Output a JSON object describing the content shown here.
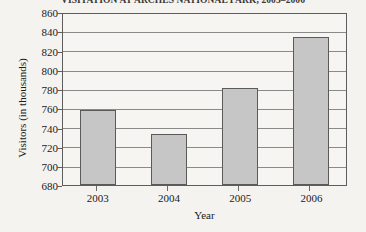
{
  "chart_data": {
    "type": "bar",
    "title": "VISITATION AT ARCHES NATIONAL PARK, 2003–2006",
    "xlabel": "Year",
    "ylabel": "Visitors (in thousands)",
    "categories": [
      "2003",
      "2004",
      "2005",
      "2006"
    ],
    "values": [
      759,
      734,
      782,
      836
    ],
    "ylim": [
      680,
      860
    ],
    "ytick_step": 20,
    "yticks": [
      "680",
      "700",
      "720",
      "740",
      "760",
      "780",
      "800",
      "820",
      "840",
      "860"
    ],
    "grid": true,
    "legend": null,
    "colors": {
      "bar_fill": "#c6c6c6",
      "bar_border": "#5a5a5a",
      "plot_background": "#f7f5f2",
      "page_background": "#f5f3f0",
      "gridline": "#8a8a8a",
      "text": "#1a1a1a"
    }
  }
}
